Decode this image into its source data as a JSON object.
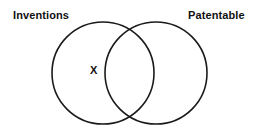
{
  "figure": {
    "kind": "venn-diagram",
    "width": 257,
    "height": 132,
    "background_color": "#ffffff",
    "stroke_color": "#1a1a1a"
  },
  "sets": {
    "left": {
      "label": "Inventions",
      "center_x": 103,
      "center_y": 73,
      "radius": 51
    },
    "right": {
      "label": "Patentable",
      "center_x": 156,
      "center_y": 73,
      "radius": 51
    }
  },
  "markers": [
    {
      "text": "X",
      "region": "left-only",
      "x": 94,
      "y": 70
    }
  ]
}
